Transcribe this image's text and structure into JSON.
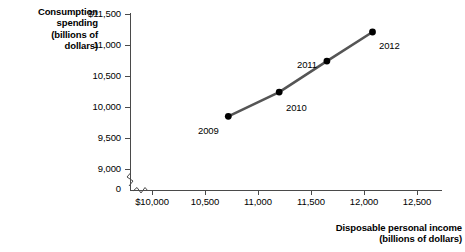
{
  "chart_data": {
    "type": "line",
    "title": "",
    "subtitle": "",
    "xlabel": "Disposable personal income (billions of dollars)",
    "ylabel": "Consumption spending (billions of dollars)",
    "xlabel_lines": [
      "Disposable personal income",
      "(billions of dollars)"
    ],
    "ylabel_lines": [
      "Consumption",
      "spending",
      "(billions of",
      "dollars)"
    ],
    "grid": false,
    "legend": "none",
    "xlim": [
      10000,
      12500
    ],
    "ylim": [
      9000,
      11500
    ],
    "x_axis_break": true,
    "y_axis_break": true,
    "x_origin_label": "0",
    "x_ticks": [
      {
        "value": 10000,
        "label": "$10,000"
      },
      {
        "value": 10500,
        "label": "10,500"
      },
      {
        "value": 11000,
        "label": "11,000"
      },
      {
        "value": 11500,
        "label": "11,500"
      },
      {
        "value": 12000,
        "label": "12,000"
      },
      {
        "value": 12500,
        "label": "12,500"
      }
    ],
    "y_ticks": [
      {
        "value": 11500,
        "label": "$11,500"
      },
      {
        "value": 11000,
        "label": "11,000"
      },
      {
        "value": 10500,
        "label": "10,500"
      },
      {
        "value": 10000,
        "label": "10,000"
      },
      {
        "value": 9500,
        "label": "9,500"
      },
      {
        "value": 9000,
        "label": "9,000"
      },
      {
        "value": 0,
        "label": "0"
      }
    ],
    "series": [
      {
        "name": "Consumption function",
        "color": "#555555",
        "marker_color": "#000000",
        "points": [
          {
            "label": "2009",
            "x": 10720,
            "y": 9850
          },
          {
            "label": "2010",
            "x": 11200,
            "y": 10240
          },
          {
            "label": "2011",
            "x": 11650,
            "y": 10740
          },
          {
            "label": "2012",
            "x": 12080,
            "y": 11210
          }
        ]
      }
    ],
    "point_labels": [
      "2009",
      "2010",
      "2011",
      "2012"
    ]
  },
  "axis_titles": {
    "y": {
      "line1": "Consumption",
      "line2": "spending",
      "line3": "(billions of",
      "line4": "dollars)"
    },
    "x": {
      "line1": "Disposable personal income",
      "line2": "(billions of dollars)"
    }
  },
  "y_tick_labels": {
    "t0": "$11,500",
    "t1": "11,000",
    "t2": "10,500",
    "t3": "10,000",
    "t4": "9,500",
    "t5": "9,000",
    "t6": "0"
  },
  "x_tick_labels": {
    "t0": "$10,000",
    "t1": "10,500",
    "t2": "11,000",
    "t3": "11,500",
    "t4": "12,000",
    "t5": "12,500"
  },
  "data_point_labels": {
    "p0": "2009",
    "p1": "2010",
    "p2": "2011",
    "p3": "2012"
  },
  "colors": {
    "line": "#555555",
    "marker": "#000000",
    "axis": "#4a4a4a",
    "text": "#000000",
    "background": "#ffffff"
  }
}
